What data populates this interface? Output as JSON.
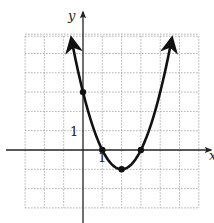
{
  "chart_data": {
    "type": "line",
    "title": "",
    "xlabel": "x",
    "ylabel": "y",
    "function": "y = x^2 - 4x + 3",
    "xlim": [
      -3,
      6
    ],
    "ylim": [
      -3,
      6
    ],
    "grid": true,
    "grid_style": "dotted",
    "tick_labels": {
      "x": [
        "1"
      ],
      "y": [
        "1"
      ]
    },
    "marked_points": [
      {
        "x": 0,
        "y": 3
      },
      {
        "x": 1,
        "y": 0
      },
      {
        "x": 2,
        "y": -1
      },
      {
        "x": 3,
        "y": 0
      }
    ],
    "series": [
      {
        "name": "parabola",
        "x": [
          -0.6,
          -0.5,
          0,
          0.5,
          1,
          1.5,
          2,
          2.5,
          3,
          3.5,
          4,
          4.5,
          4.6
        ],
        "y": [
          5.76,
          5.25,
          3,
          1.25,
          0,
          -0.75,
          -1,
          -0.75,
          0,
          1.25,
          3,
          5.25,
          5.76
        ]
      }
    ],
    "arrows": "both ends of curve point upward"
  },
  "labels": {
    "x_axis": "x",
    "y_axis": "y",
    "x_tick": "1",
    "y_tick": "1"
  },
  "colors": {
    "curve": "#111111",
    "grid": "#9a9a9a",
    "axes": "#222222"
  }
}
